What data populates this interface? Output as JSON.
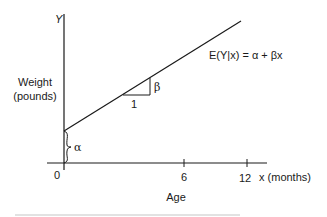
{
  "diagram": {
    "y_axis_label": "Y",
    "y_axis_title_line1": "Weight",
    "y_axis_title_line2": "(pounds)",
    "x_axis_title": "Age",
    "x_axis_unit_label": "x (months)",
    "x_ticks": [
      "0",
      "6",
      "12"
    ],
    "equation": "E(Y|x) = α + βx",
    "intercept_label": "α",
    "slope_rise_label": "β",
    "slope_run_label": "1",
    "colors": {
      "ink": "#1a1a1a",
      "background": "#ffffff",
      "footer_rule": "#d9d9d9"
    }
  }
}
